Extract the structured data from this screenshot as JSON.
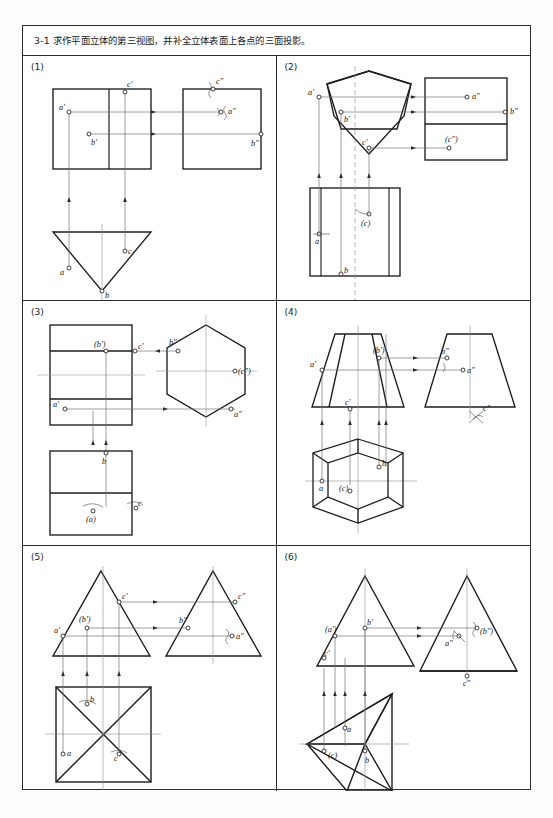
{
  "header": {
    "exercise_number": "3-1",
    "instruction": "3-1  求作平面立体的第三视图，并补全立体表面上各点的三面投影。"
  },
  "panels": [
    {
      "number": "(1)",
      "solid": "triangular prism",
      "views": [
        "front rectangle with vertical edge",
        "side rectangle",
        "top inverted triangle"
      ],
      "points": [
        {
          "label": "a'",
          "view": "front"
        },
        {
          "label": "b'",
          "view": "front"
        },
        {
          "label": "c'",
          "view": "front"
        },
        {
          "label": "a″",
          "view": "side"
        },
        {
          "label": "b″",
          "view": "side"
        },
        {
          "label": "c″",
          "view": "side"
        },
        {
          "label": "a",
          "view": "top"
        },
        {
          "label": "b",
          "view": "top"
        },
        {
          "label": "c",
          "view": "top"
        }
      ]
    },
    {
      "number": "(2)",
      "solid": "pentagonal prism",
      "views": [
        "front pentagon",
        "side rectangle split",
        "top rectangle with vertical divisions"
      ],
      "points": [
        {
          "label": "a'",
          "view": "front"
        },
        {
          "label": "b'",
          "view": "front"
        },
        {
          "label": "c'",
          "view": "front"
        },
        {
          "label": "a″",
          "view": "side"
        },
        {
          "label": "b″",
          "view": "side"
        },
        {
          "label": "(c″)",
          "view": "side"
        },
        {
          "label": "a",
          "view": "top"
        },
        {
          "label": "b",
          "view": "top"
        },
        {
          "label": "(c)",
          "view": "top"
        }
      ]
    },
    {
      "number": "(3)",
      "solid": "hexagonal prism",
      "views": [
        "front rectangle with horizontal bands",
        "side hexagon",
        "top rectangle"
      ],
      "points": [
        {
          "label": "(b')",
          "view": "front"
        },
        {
          "label": "c'",
          "view": "front"
        },
        {
          "label": "a'",
          "view": "front"
        },
        {
          "label": "b″",
          "view": "side"
        },
        {
          "label": "(c″)",
          "view": "side"
        },
        {
          "label": "a″",
          "view": "side"
        },
        {
          "label": "b",
          "view": "top"
        },
        {
          "label": "(a)",
          "view": "top"
        },
        {
          "label": "c",
          "view": "top"
        }
      ]
    },
    {
      "number": "(4)",
      "solid": "hexagonal frustum",
      "views": [
        "front trapezoid",
        "side trapezoid",
        "top hexagon with inner hexagon"
      ],
      "points": [
        {
          "label": "a'",
          "view": "front"
        },
        {
          "label": "(b')",
          "view": "front"
        },
        {
          "label": "c'",
          "view": "front"
        },
        {
          "label": "b″",
          "view": "side"
        },
        {
          "label": "a″",
          "view": "side"
        },
        {
          "label": "c″",
          "view": "side"
        },
        {
          "label": "a",
          "view": "top"
        },
        {
          "label": "(c)",
          "view": "top"
        },
        {
          "label": "b",
          "view": "top"
        }
      ]
    },
    {
      "number": "(5)",
      "solid": "square pyramid",
      "views": [
        "front triangle",
        "side triangle",
        "top square with diagonals"
      ],
      "points": [
        {
          "label": "c'",
          "view": "front"
        },
        {
          "label": "(b')",
          "view": "front"
        },
        {
          "label": "a'",
          "view": "front"
        },
        {
          "label": "c″",
          "view": "side"
        },
        {
          "label": "b″",
          "view": "side"
        },
        {
          "label": "a″",
          "view": "side"
        },
        {
          "label": "b",
          "view": "top"
        },
        {
          "label": "a",
          "view": "top"
        },
        {
          "label": "c",
          "view": "top"
        }
      ]
    },
    {
      "number": "(6)",
      "solid": "triangular pyramid",
      "views": [
        "front triangle",
        "side triangle",
        "top triangle with internal edges"
      ],
      "points": [
        {
          "label": "(a')",
          "view": "front"
        },
        {
          "label": "b'",
          "view": "front"
        },
        {
          "label": "c'",
          "view": "front"
        },
        {
          "label": "a″",
          "view": "side"
        },
        {
          "label": "(b″)",
          "view": "side"
        },
        {
          "label": "c″",
          "view": "side"
        },
        {
          "label": "a",
          "view": "top"
        },
        {
          "label": "(c)",
          "view": "top"
        },
        {
          "label": "b",
          "view": "top"
        }
      ]
    }
  ],
  "colors": {
    "line": "#1c1c1c",
    "thin_line": "#6a6a6a",
    "center_line": "#9a9a9a",
    "border": "#2b2b2b",
    "paper": "#ffffff"
  }
}
